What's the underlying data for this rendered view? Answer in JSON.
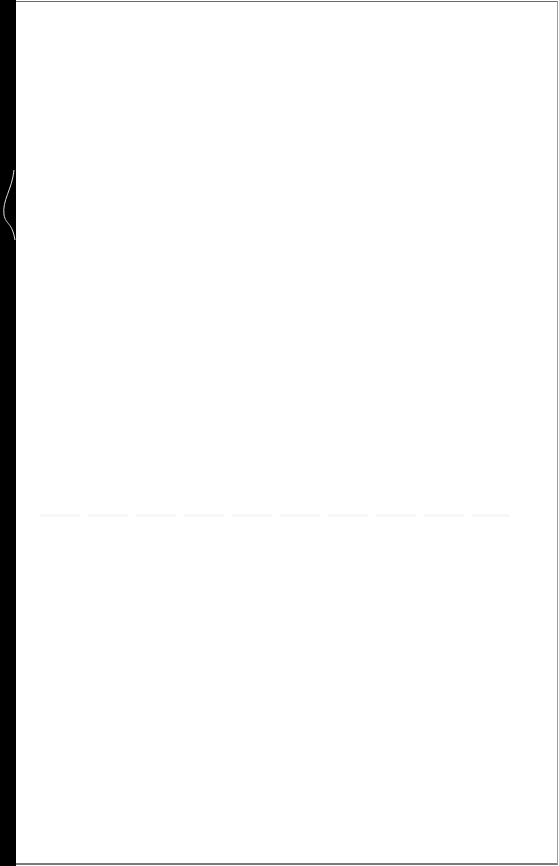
{
  "document": {
    "type": "scanned-page",
    "content": "",
    "colors": {
      "page": "#ffffff",
      "binding": "#000000",
      "border": "#7a7a7a"
    }
  }
}
